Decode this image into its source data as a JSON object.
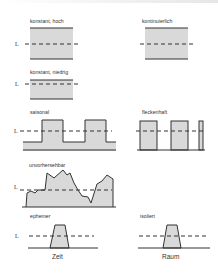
{
  "diagram": {
    "level_label": "L",
    "colors": {
      "fill": "#d9d9d9",
      "line": "#333333",
      "dash": "#333333"
    },
    "panels": [
      {
        "id": "konstant-hoch",
        "label": "konstant, hoch",
        "column": "Zeit"
      },
      {
        "id": "kontinuierlich",
        "label": "kontinuierlich",
        "column": "Raum"
      },
      {
        "id": "konstant-niedrig",
        "label": "konstant, niedrig",
        "column": "Zeit"
      },
      {
        "id": "saisonal",
        "label": "saisonal",
        "column": "Zeit"
      },
      {
        "id": "fleckenhaft",
        "label": "fleckenhaft",
        "column": "Raum"
      },
      {
        "id": "unvorhersehbar",
        "label": "unvorhersehbar",
        "column": "Zeit"
      },
      {
        "id": "ephemer",
        "label": "ephemer",
        "column": "Zeit"
      },
      {
        "id": "isoliert",
        "label": "isoliert",
        "column": "Raum"
      }
    ],
    "axis_labels": {
      "left": "Zeit",
      "right": "Raum"
    }
  }
}
